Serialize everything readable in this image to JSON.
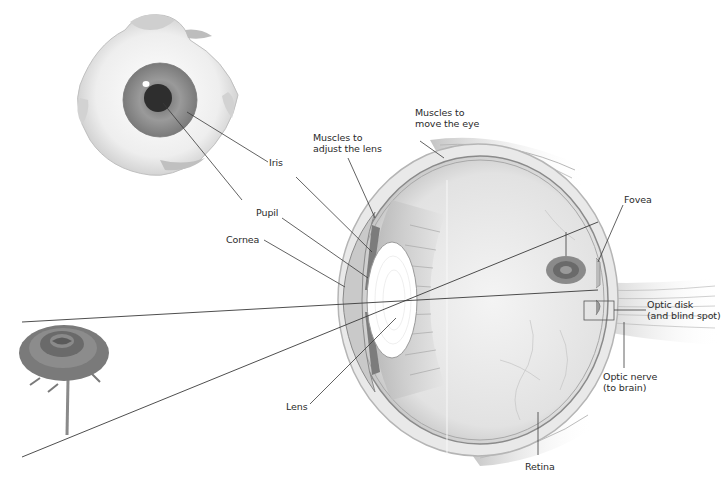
{
  "figure": {
    "front_view": {
      "name": "Eye (front view)"
    },
    "cross_section": {
      "name": "Eye (cross-section)"
    },
    "stimulus": {
      "name": "Rose",
      "image_name": "Inverted rose image on retina"
    }
  },
  "labels": {
    "iris": "Iris",
    "pupil": "Pupil",
    "cornea": "Cornea",
    "lens": "Lens",
    "muscles_lens_1": "Muscles to",
    "muscles_lens_2": "adjust the lens",
    "muscles_eye_1": "Muscles to",
    "muscles_eye_2": "move the eye",
    "fovea": "Fovea",
    "optic_disk_1": "Optic disk",
    "optic_disk_2": "(and blind spot)",
    "optic_nerve_1": "Optic nerve",
    "optic_nerve_2": "(to brain)",
    "retina": "Retina"
  },
  "colors": {
    "line": "#3a3a3a",
    "tissue": "#d8d8d8",
    "tissue_dark": "#9a9a9a",
    "vitreous": "#ececec",
    "iris": "#8f8f8f",
    "pupil": "#2e2e2e",
    "rose": "#6e6e6e"
  }
}
